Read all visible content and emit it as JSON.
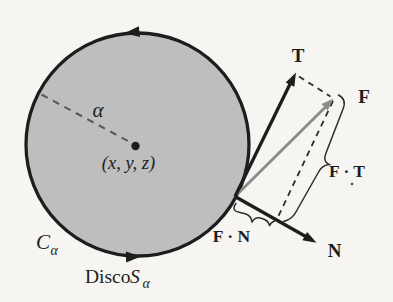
{
  "figure": {
    "background_color": "#f6f5f1",
    "disc": {
      "fill_color": "#bebebe",
      "outline_color": "#1d1d1d",
      "radius_label": "α",
      "center_label": "(x, y, z)",
      "boundary_label": "C",
      "boundary_label_sub": "α",
      "disc_label": "Disco",
      "disc_label_var": "S",
      "disc_label_sub": "α"
    },
    "vectors": {
      "line_color": "#1d1d1d",
      "f_color": "#8c8c8c",
      "tangent_label": "T",
      "field_label": "F",
      "normal_label": "N"
    },
    "projections": {
      "guide_color": "#2e2e2e",
      "dash_color": "#5a5a5a",
      "ft_label": "F · T",
      "fn_label": "F · N"
    }
  }
}
